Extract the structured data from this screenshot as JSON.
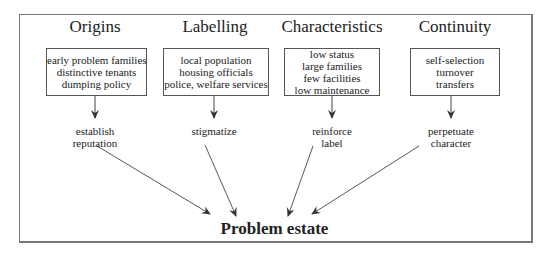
{
  "diagram": {
    "columns": [
      {
        "heading": "Origins",
        "box_items": [
          "early problem families",
          "distinctive tenants",
          "dumping policy"
        ],
        "result_lines": [
          "establish",
          "reputation"
        ]
      },
      {
        "heading": "Labelling",
        "box_items": [
          "local population",
          "housing officials",
          "police, welfare services"
        ],
        "result_lines": [
          "stigmatize"
        ]
      },
      {
        "heading": "Characteristics",
        "box_items": [
          "low status",
          "large families",
          "few facilities",
          "low maintenance"
        ],
        "result_lines": [
          "reinforce",
          "label"
        ]
      },
      {
        "heading": "Continuity",
        "box_items": [
          "self-selection",
          "turnover",
          "transfers"
        ],
        "result_lines": [
          "perpetuate",
          "character"
        ]
      }
    ],
    "outcome": "Problem estate",
    "colors": {
      "line": "#444444",
      "frame": "#777777",
      "text": "#222222"
    }
  }
}
